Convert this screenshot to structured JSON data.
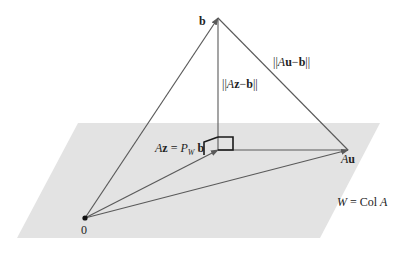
{
  "diagram": {
    "colors": {
      "background": "#ffffff",
      "plane": "#e3e3e3",
      "line": "#5a5a5a",
      "right_angle": "#1a1a1a",
      "text": "#222222",
      "origin_dot": "#111111"
    },
    "plane": {
      "points": "78,123 380,123 320,238 17,238"
    },
    "points": {
      "origin": {
        "x": 85,
        "y": 218
      },
      "b": {
        "x": 218,
        "y": 18
      },
      "Az": {
        "x": 218,
        "y": 150
      },
      "Au": {
        "x": 348,
        "y": 150
      }
    },
    "labels": {
      "b": "b",
      "origin": "0",
      "Az_lhs_A": "A",
      "Az_lhs_z": "z",
      "Az_eq": " = ",
      "Az_P": "P",
      "Az_sub": "W",
      "Az_b": " b",
      "Au_A": "A",
      "Au_u": "u",
      "norm_Az_open": "||",
      "norm_Az_A": "A",
      "norm_Az_z": "z",
      "norm_Az_minus": "−",
      "norm_Az_b": "b",
      "norm_Az_close": "||",
      "norm_Au_open": "||",
      "norm_Au_A": "A",
      "norm_Au_u": "u",
      "norm_Au_minus": "−",
      "norm_Au_b": "b",
      "norm_Au_close": "||",
      "W_W": "W",
      "W_eq": " = Col ",
      "W_A": "A"
    }
  }
}
